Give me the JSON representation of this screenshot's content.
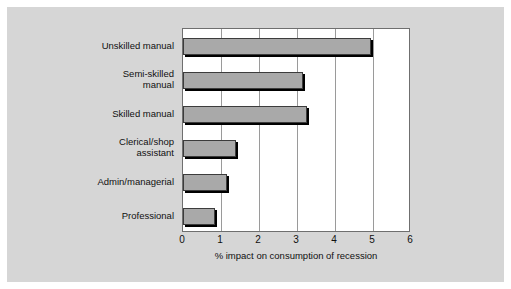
{
  "chart_data": {
    "type": "bar",
    "orientation": "horizontal",
    "title": "",
    "xlabel": "% impact on consumption of recession",
    "ylabel": "",
    "categories": [
      "Unskilled manual",
      "Semi-skilled\nmanual",
      "Skilled manual",
      "Clerical/shop\nassistant",
      "Admin/managerial",
      "Professional"
    ],
    "values": [
      4.95,
      3.15,
      3.25,
      1.4,
      1.15,
      0.85
    ],
    "xlim": [
      0,
      6
    ],
    "xticks": [
      0,
      1,
      2,
      3,
      4,
      5,
      6
    ],
    "xtick_labels": [
      "0",
      "1",
      "2",
      "3",
      "4",
      "5",
      "6"
    ],
    "grid": true,
    "grid_axis": "x",
    "legend": false,
    "bar_color": "#a9a9a9",
    "bar_edge_color": "#3c3c3c",
    "plot_background": "#ffffff",
    "panel_background": "#d6d6d6",
    "axis_color": "#6f6f6f",
    "gridline_color": "#9a9a9a",
    "text_color": "#101010"
  }
}
